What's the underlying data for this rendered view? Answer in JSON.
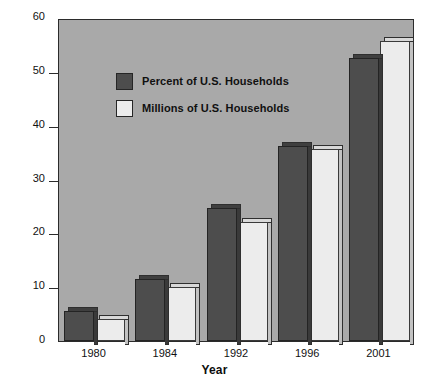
{
  "chart_data": {
    "type": "bar",
    "title": "",
    "xlabel": "Year",
    "ylabel": "",
    "categories": [
      "1980",
      "1984",
      "1992",
      "1996",
      "2001"
    ],
    "series": [
      {
        "name": "Percent of U.S. Households",
        "color": "#4d4d4d",
        "values": [
          5.6,
          11.5,
          24.7,
          36.3,
          52.6
        ]
      },
      {
        "name": "Millions of U.S. Households",
        "color": "#ececec",
        "values": [
          4.1,
          10.0,
          22.2,
          35.6,
          55.8
        ]
      }
    ],
    "ylim": [
      0,
      60
    ],
    "ytick_values": [
      0,
      10,
      20,
      30,
      40,
      50,
      60
    ],
    "ytick_labels": [
      "0",
      "10",
      "20",
      "30",
      "40",
      "50",
      "60"
    ],
    "grid": false,
    "legend_position": "upper-left",
    "plot_background_color": "#a9a9a9",
    "axis_color": "#2b2b2b"
  },
  "legend": {
    "entries": [
      {
        "label": "Percent of U.S. Households",
        "swatch": "dark"
      },
      {
        "label": "Millions of U.S. Households",
        "swatch": "light"
      }
    ]
  },
  "axis": {
    "x_title": "Year"
  }
}
